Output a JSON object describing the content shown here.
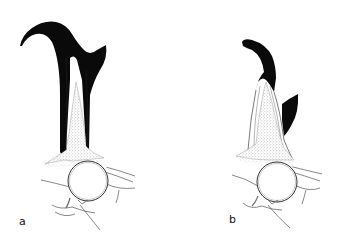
{
  "figure": {
    "panels": [
      {
        "id": "a",
        "label": "a"
      },
      {
        "id": "b",
        "label": "b"
      }
    ],
    "colors": {
      "ink": "#0a0a0a",
      "line": "#444444",
      "stipple": "#9a9a9a",
      "background": "#ffffff"
    }
  }
}
